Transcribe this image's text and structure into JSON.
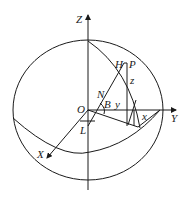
{
  "diagram": {
    "type": "celestial-sphere-coordinate-diagram",
    "colors": {
      "stroke": "#1a1a1a",
      "background": "#ffffff"
    },
    "labels": {
      "z_axis": "Z",
      "y_axis": "Y",
      "x_axis": "X",
      "origin": "O",
      "point_h": "H",
      "point_p": "P",
      "point_n": "N",
      "point_b": "B",
      "point_l": "L",
      "coord_x": "x",
      "coord_y": "y",
      "coord_z": "z"
    }
  }
}
